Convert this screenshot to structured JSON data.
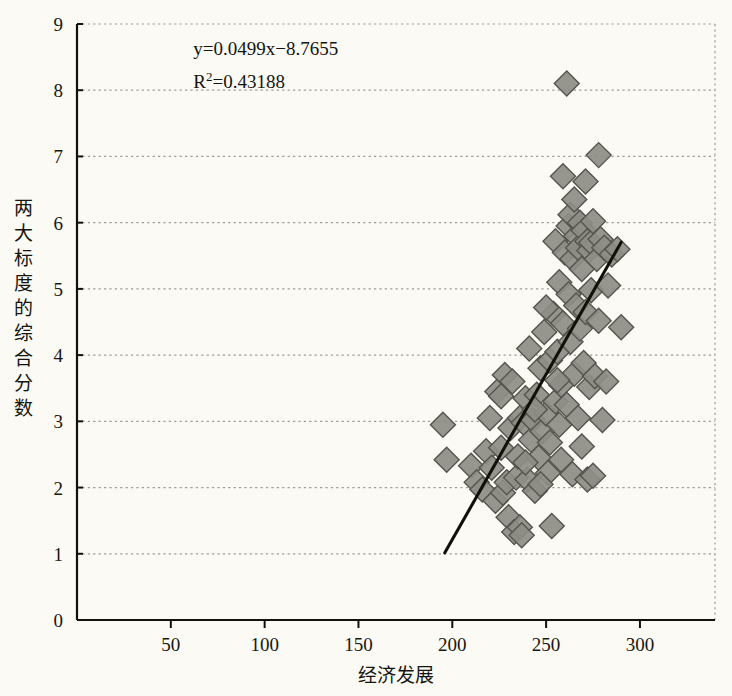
{
  "chart_data": {
    "type": "scatter",
    "title": "",
    "xlabel": "经济发展",
    "ylabel": "两大标度的综合分数",
    "xlim": [
      0,
      340
    ],
    "ylim": [
      0,
      9
    ],
    "xticks": [
      50,
      100,
      150,
      200,
      250,
      300
    ],
    "yticks": [
      0,
      1,
      2,
      3,
      4,
      5,
      6,
      7,
      8,
      9
    ],
    "grid": "horizontal-dotted",
    "legend": "none",
    "marker": "diamond",
    "marker_fill": "#8d8d86",
    "marker_edge": "#55554f",
    "annotations": [
      {
        "text": "y=0.0499x−8.7655",
        "x": 62,
        "y": 8.62
      },
      {
        "text": "R²=0.43188",
        "x": 62,
        "y": 8.13
      }
    ],
    "trendline": {
      "equation": "y=0.0499x−8.7655",
      "slope": 0.0499,
      "intercept": -8.7655,
      "r_squared": 0.43188,
      "x_start": 196,
      "x_end": 290,
      "color": "#111109"
    },
    "points": [
      [
        195,
        2.95
      ],
      [
        197,
        2.42
      ],
      [
        210,
        2.33
      ],
      [
        213,
        2.08
      ],
      [
        216,
        1.97
      ],
      [
        218,
        2.55
      ],
      [
        220,
        3.05
      ],
      [
        221,
        2.3
      ],
      [
        223,
        1.8
      ],
      [
        224,
        3.45
      ],
      [
        226,
        2.6
      ],
      [
        227,
        1.92
      ],
      [
        228,
        3.7
      ],
      [
        229,
        2.08
      ],
      [
        230,
        1.55
      ],
      [
        231,
        2.9
      ],
      [
        232,
        3.6
      ],
      [
        233,
        1.33
      ],
      [
        234,
        2.15
      ],
      [
        235,
        2.47
      ],
      [
        236,
        3.05
      ],
      [
        236,
        1.4
      ],
      [
        237,
        1.28
      ],
      [
        238,
        2.98
      ],
      [
        239,
        3.35
      ],
      [
        240,
        2.12
      ],
      [
        241,
        4.1
      ],
      [
        242,
        2.72
      ],
      [
        243,
        3.02
      ],
      [
        244,
        1.95
      ],
      [
        245,
        3.4
      ],
      [
        246,
        2.45
      ],
      [
        247,
        3.8
      ],
      [
        248,
        2.85
      ],
      [
        249,
        4.35
      ],
      [
        250,
        3.12
      ],
      [
        251,
        2.22
      ],
      [
        252,
        3.92
      ],
      [
        253,
        1.42
      ],
      [
        254,
        4.62
      ],
      [
        255,
        3.3
      ],
      [
        255,
        5.72
      ],
      [
        256,
        4.05
      ],
      [
        257,
        2.95
      ],
      [
        257,
        5.1
      ],
      [
        258,
        3.55
      ],
      [
        259,
        4.48
      ],
      [
        259,
        6.7
      ],
      [
        260,
        5.55
      ],
      [
        261,
        8.1
      ],
      [
        261,
        3.25
      ],
      [
        262,
        4.92
      ],
      [
        262,
        5.95
      ],
      [
        263,
        4.2
      ],
      [
        263,
        6.12
      ],
      [
        264,
        2.2
      ],
      [
        264,
        5.45
      ],
      [
        265,
        3.72
      ],
      [
        265,
        6.35
      ],
      [
        266,
        4.75
      ],
      [
        266,
        5.8
      ],
      [
        267,
        3.05
      ],
      [
        267,
        5.62
      ],
      [
        268,
        4.4
      ],
      [
        268,
        6.0
      ],
      [
        269,
        2.62
      ],
      [
        269,
        5.3
      ],
      [
        270,
        3.88
      ],
      [
        270,
        5.88
      ],
      [
        271,
        4.65
      ],
      [
        271,
        6.62
      ],
      [
        272,
        2.12
      ],
      [
        272,
        5.72
      ],
      [
        273,
        3.52
      ],
      [
        273,
        5.58
      ],
      [
        274,
        4.98
      ],
      [
        274,
        5.7
      ],
      [
        275,
        2.18
      ],
      [
        275,
        6.02
      ],
      [
        276,
        3.68
      ],
      [
        277,
        5.45
      ],
      [
        278,
        7.02
      ],
      [
        278,
        4.52
      ],
      [
        279,
        5.75
      ],
      [
        280,
        3.02
      ],
      [
        281,
        5.62
      ],
      [
        282,
        3.6
      ],
      [
        283,
        5.05
      ],
      [
        285,
        5.52
      ],
      [
        288,
        5.6
      ],
      [
        290,
        4.42
      ],
      [
        226,
        3.38
      ],
      [
        239,
        2.38
      ],
      [
        247,
        2.05
      ],
      [
        252,
        2.68
      ],
      [
        258,
        2.42
      ],
      [
        244,
        3.18
      ],
      [
        250,
        4.72
      ],
      [
        256,
        3.62
      ]
    ]
  }
}
